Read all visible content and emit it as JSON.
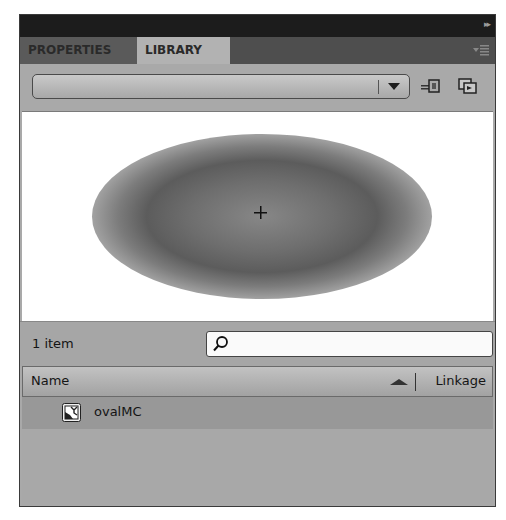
{
  "panel": {
    "collapse_glyph": "▸▸",
    "tabs": [
      {
        "label": "PROPERTIES",
        "active": false
      },
      {
        "label": "LIBRARY",
        "active": true
      }
    ],
    "menu_icon": "panel-menu-icon"
  },
  "toolbar": {
    "document_dropdown": {
      "value": ""
    },
    "pin_button_icon": "pin-library-icon",
    "new_library_button_icon": "new-library-panel-icon"
  },
  "preview": {
    "symbol": "oval-gradient-movieclip",
    "registration_mark": "+"
  },
  "library": {
    "item_count": "1 item",
    "search": {
      "value": "",
      "placeholder": ""
    },
    "columns": {
      "name": "Name",
      "linkage": "Linkage",
      "sort": "ascending"
    },
    "items": [
      {
        "name": "ovalMC",
        "type": "movie-clip",
        "linkage": "",
        "selected": true
      }
    ]
  }
}
